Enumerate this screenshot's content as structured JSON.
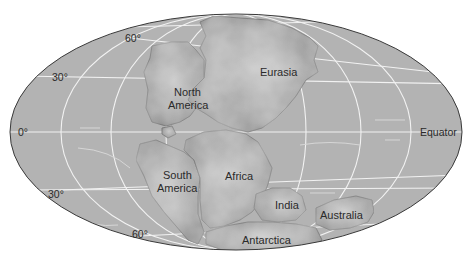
{
  "map": {
    "projection": "Mollweide-style oval world map",
    "colors": {
      "ocean": "#b3b3b3",
      "land": "#9a9a9a",
      "land_highlight": "#c4c4c4",
      "grid": "#f2f2f2",
      "outline": "#3a3a3a",
      "text": "#2a2a2a",
      "background": "#ffffff"
    },
    "latitude_labels": {
      "n60": "60°",
      "n30": "30°",
      "eq": "0°",
      "s30": "30°",
      "s60": "60°"
    },
    "equator_label": "Equator",
    "continents": {
      "north_america_1": "North",
      "north_america_2": "America",
      "eurasia": "Eurasia",
      "south_america_1": "South",
      "south_america_2": "America",
      "africa": "Africa",
      "india": "India",
      "australia": "Australia",
      "antarctica": "Antarctica"
    }
  }
}
